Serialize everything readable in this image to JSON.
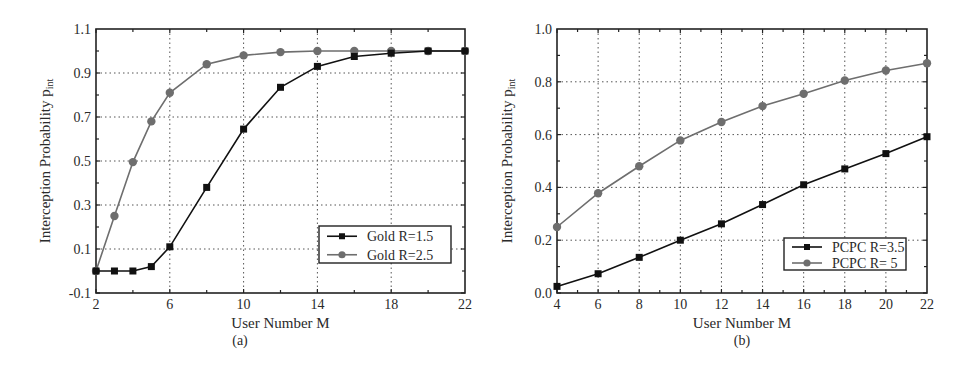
{
  "chart_data": [
    {
      "id": "a",
      "type": "line",
      "caption": "(a)",
      "title": "",
      "xlabel": "User Number M",
      "ylabel": "Interception Probability p",
      "ylabel_sub": "int",
      "xlim": [
        2,
        22
      ],
      "ylim": [
        -0.1,
        1.1
      ],
      "xticks": [
        2,
        6,
        10,
        14,
        18,
        22
      ],
      "yticks": [
        -0.1,
        0.1,
        0.3,
        0.5,
        0.7,
        0.9,
        1.1
      ],
      "ytick_labels": [
        "-0.1",
        "0.1",
        "0.3",
        "0.5",
        "0.7",
        "0.9",
        "1.1"
      ],
      "grid": true,
      "legend_position": "lower right",
      "series": [
        {
          "name": "Gold R=1.5",
          "marker": "square",
          "color": "#111111",
          "x": [
            2,
            3,
            4,
            5,
            6,
            8,
            10,
            12,
            14,
            16,
            18,
            20,
            22
          ],
          "y": [
            0.0,
            0.0,
            0.0,
            0.02,
            0.11,
            0.38,
            0.645,
            0.835,
            0.93,
            0.975,
            0.99,
            1.0,
            1.0
          ]
        },
        {
          "name": "Gold R=2.5",
          "marker": "circle",
          "color": "#6e6e6e",
          "x": [
            2,
            3,
            4,
            5,
            6,
            8,
            10,
            12,
            14,
            16,
            18,
            20,
            22
          ],
          "y": [
            0.0,
            0.25,
            0.495,
            0.68,
            0.81,
            0.94,
            0.98,
            0.995,
            1.0,
            1.0,
            1.0,
            1.0,
            1.0
          ]
        }
      ]
    },
    {
      "id": "b",
      "type": "line",
      "caption": "(b)",
      "title": "",
      "xlabel": "User Number M",
      "ylabel": "Interception Probability p",
      "ylabel_sub": "int",
      "xlim": [
        4,
        22
      ],
      "ylim": [
        0.0,
        1.0
      ],
      "xticks": [
        4,
        6,
        8,
        10,
        12,
        14,
        16,
        18,
        20,
        22
      ],
      "yticks": [
        0.0,
        0.2,
        0.4,
        0.6,
        0.8,
        1.0
      ],
      "ytick_labels": [
        "0.0",
        "0.2",
        "0.4",
        "0.6",
        "0.8",
        "1.0"
      ],
      "grid": true,
      "legend_position": "lower right",
      "series": [
        {
          "name": "PCPC R=3.5",
          "marker": "square",
          "color": "#111111",
          "x": [
            4,
            6,
            8,
            10,
            12,
            14,
            16,
            18,
            20,
            22
          ],
          "y": [
            0.025,
            0.073,
            0.135,
            0.2,
            0.262,
            0.335,
            0.41,
            0.47,
            0.528,
            0.592
          ]
        },
        {
          "name": "PCPC R= 5",
          "marker": "circle",
          "color": "#6e6e6e",
          "x": [
            4,
            6,
            8,
            10,
            12,
            14,
            16,
            18,
            20,
            22
          ],
          "y": [
            0.25,
            0.378,
            0.48,
            0.578,
            0.648,
            0.708,
            0.755,
            0.805,
            0.843,
            0.87
          ]
        }
      ]
    }
  ]
}
